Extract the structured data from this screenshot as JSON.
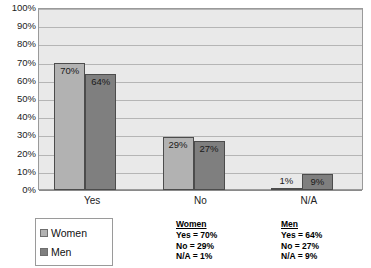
{
  "chart_data": {
    "type": "bar",
    "title": "",
    "subtitle": "",
    "xlabel": "",
    "ylabel": "",
    "categories": [
      "Yes",
      "No",
      "N/A"
    ],
    "series": [
      {
        "name": "Women",
        "values": [
          70,
          29,
          1
        ],
        "color": "#b2b2b2"
      },
      {
        "name": "Men",
        "values": [
          64,
          27,
          9
        ],
        "color": "#7f7f7f"
      }
    ],
    "value_labels": [
      [
        "70%",
        "29%",
        "1%"
      ],
      [
        "64%",
        "27%",
        "9%"
      ]
    ],
    "ylim": [
      0,
      100
    ],
    "ytick_step": 10,
    "ytick_labels": [
      "100%",
      "90%",
      "80%",
      "70%",
      "60%",
      "50%",
      "40%",
      "30%",
      "20%",
      "10%",
      "0%"
    ],
    "grid": true,
    "legend_position": "bottom-left",
    "plot_background": "#e9e9e9",
    "gridline_color": "#b5b5b5"
  },
  "legend": {
    "items": [
      {
        "label": "Women",
        "swatch": "women"
      },
      {
        "label": "Men",
        "swatch": "men"
      }
    ]
  },
  "summary": {
    "women": {
      "heading": "Women",
      "lines": [
        "Yes = 70%",
        "No = 29%",
        "N/A = 1%"
      ]
    },
    "men": {
      "heading": "Men",
      "lines": [
        "Yes = 64%",
        "No = 27%",
        "N/A = 9%"
      ]
    }
  }
}
